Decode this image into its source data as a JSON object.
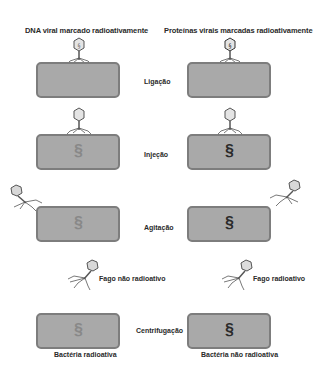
{
  "columns": {
    "left_title": "DNA viral marcado radioativamente",
    "right_title": "Proteínas virais marcadas radioativamente"
  },
  "steps": [
    {
      "label": "Ligação"
    },
    {
      "label": "Injeção"
    },
    {
      "label": "Agitação"
    },
    {
      "label": "Centrifugação"
    }
  ],
  "phage_labels": {
    "left": "Fago não radioativo",
    "right": "Fago radioativo"
  },
  "result_labels": {
    "left": "Bactéria radioativa",
    "right": "Bactéria não radioativa"
  },
  "colors": {
    "cell_fill": "#a9a9a9",
    "cell_border": "#7d7d7d",
    "dna_light": "#8a8a8a",
    "dna_dark": "#2b2b2b",
    "phage_head": "#d8d8d8"
  }
}
